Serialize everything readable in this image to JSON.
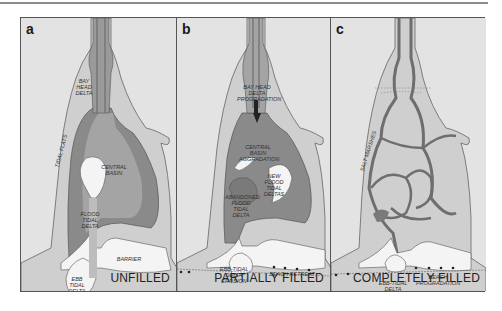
{
  "figure": {
    "panels": [
      {
        "letter": "a",
        "caption": "UNFILLED",
        "labels": {
          "bay_head_delta": "BAY HEAD DELTA",
          "tidal_flats": "TIDAL FLATS",
          "central_basin": "CENTRAL BASIN",
          "flood_tidal_delta": "FLOOD TIDAL DELTA",
          "barrier": "BARRIER",
          "ebb_tidal_delta": "EBB TIDAL DELTA"
        }
      },
      {
        "letter": "b",
        "caption": "PARTIALLY FILLED",
        "labels": {
          "bay_head_delta_progradation": "BAY HEAD DELTA PROGRADATION",
          "central_basin_aggradation": "CENTRAL BASIN AGGRADATION",
          "new_flood_tidal_deltas": "NEW FLOOD TIDAL DELTAS",
          "abandoned_flood_tidal_delta": "ABANDONED FLOOD TIDAL DELTA",
          "ebb_tidal_delta_erosion": "EBB-TIDAL DELTA EROSION",
          "beach_retreat": "BEACH RETREAT"
        }
      },
      {
        "letter": "c",
        "caption": "COMPLETELY FILLED",
        "labels": {
          "salt_marshes": "SALT MARSHES",
          "ebb_tidal_delta_erosion": "EBB-TIDAL DELTA EROSION",
          "beach_progradation": "BEACH PROGRADATION"
        }
      }
    ],
    "colors": {
      "background": "#e3e3e3",
      "light_fill": "#cfcfcf",
      "basin": "#9a9a9a",
      "dark_basin": "#7a7a7a",
      "channel": "#6e6e6e",
      "sand": "#f4f4f4",
      "outline": "#555555"
    }
  }
}
